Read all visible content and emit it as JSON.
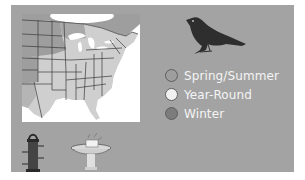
{
  "card": {
    "background_color": "#a3a3a3",
    "map": {
      "icon": "range-map",
      "region": "Eastern United States",
      "colors": {
        "year_round": "#cfcfcf",
        "spring_summer": "#9e9e9e",
        "winter": "#8a8a8a",
        "water": "#ffffff",
        "borders": "#3a3a3a"
      }
    },
    "bird": {
      "icon": "bird-silhouette",
      "color": "#2e2e2e"
    },
    "legend": {
      "items": [
        {
          "label": "Spring/Summer",
          "color": "#9e9e9e"
        },
        {
          "label": "Year-Round",
          "color": "#f0f0f0"
        },
        {
          "label": "Winter",
          "color": "#7c7c7c"
        }
      ]
    },
    "feeding": [
      {
        "icon": "tube-feeder-icon"
      },
      {
        "icon": "birdbath-icon"
      }
    ]
  }
}
